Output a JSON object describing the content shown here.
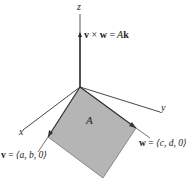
{
  "diagram": {
    "axes": {
      "x_label": "x",
      "y_label": "y",
      "z_label": "z"
    },
    "area_label": "A",
    "cross_product": {
      "lhs_v": "v",
      "times": "×",
      "lhs_w": "w",
      "equals": "=",
      "rhs_scalar": "A",
      "rhs_vector": "k"
    },
    "vector_v": {
      "name": "v",
      "equals": "=",
      "components": "⟨a, b, 0⟩"
    },
    "vector_w": {
      "name": "w",
      "equals": "=",
      "components": "⟨c, d, 0⟩"
    },
    "colors": {
      "parallelogram_fill": "#b5b5b5",
      "axis_stroke": "#333333",
      "text": "#222222"
    }
  }
}
